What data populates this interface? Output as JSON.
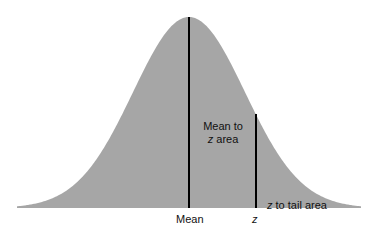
{
  "diagram": {
    "fill_color": "#a6a6a6",
    "line_color": "#000000",
    "mean_to_z_label_line1": "Mean to",
    "mean_to_z_label_line2_z": "z",
    "mean_to_z_label_line2_rest": " area",
    "tail_label_z": "z",
    "tail_label_rest": " to tail area",
    "axis_label_mean": "Mean",
    "axis_label_z": "z"
  },
  "chart_data": {
    "type": "area",
    "title": "",
    "xlabel": "",
    "ylabel": "",
    "x_ticks": [
      "Mean",
      "z"
    ],
    "z_position_sd": 1.2,
    "annotations": [
      "Mean to z area",
      "z to tail area"
    ],
    "grid": false,
    "legend": null
  }
}
